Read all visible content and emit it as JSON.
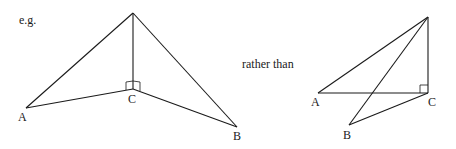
{
  "caption_eg": "e.g.",
  "caption_rather": "rather than",
  "left_figure": {
    "labels": {
      "A": "A",
      "B": "B",
      "C": "C"
    }
  },
  "right_figure": {
    "labels": {
      "A": "A",
      "B": "B",
      "C": "C"
    }
  },
  "colors": {
    "line": "#1a1a1a",
    "background": "#ffffff"
  }
}
